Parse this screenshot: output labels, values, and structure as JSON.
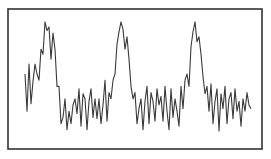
{
  "chart_data": {
    "type": "line",
    "title": "",
    "xlabel": "",
    "ylabel": "",
    "grid": false,
    "legend": null,
    "axes_ticks": false,
    "frame": {
      "x0": 8,
      "y0": 9,
      "x1": 262,
      "y1": 149,
      "color": "#333333"
    },
    "line_color": "#3a3a3a",
    "ylim": [
      0,
      100
    ],
    "series": [
      {
        "name": "signal",
        "x": [
          25,
          27,
          29,
          31,
          33,
          35,
          37,
          39,
          41,
          43,
          45,
          47,
          49,
          51,
          53,
          55,
          57,
          59,
          61,
          63,
          65,
          67,
          69,
          71,
          73,
          75,
          77,
          79,
          81,
          83,
          85,
          87,
          89,
          91,
          93,
          95,
          97,
          99,
          101,
          103,
          105,
          107,
          109,
          111,
          113,
          115,
          117,
          119,
          121,
          123,
          125,
          127,
          129,
          131,
          133,
          135,
          137,
          139,
          141,
          143,
          145,
          147,
          149,
          151,
          153,
          155,
          157,
          159,
          161,
          163,
          165,
          167,
          169,
          171,
          173,
          175,
          177,
          179,
          181,
          183,
          185,
          187,
          189,
          191,
          193,
          195,
          197,
          199,
          201,
          203,
          205,
          207,
          209,
          211,
          213,
          215,
          217,
          219,
          221,
          223,
          225,
          227,
          229,
          231,
          233,
          235,
          237,
          239,
          241,
          243,
          245,
          247,
          249,
          251
        ],
        "values": [
          50,
          20,
          58,
          26,
          44,
          58,
          50,
          45,
          70,
          66,
          92,
          85,
          88,
          62,
          83,
          70,
          40,
          40,
          10,
          15,
          30,
          5,
          20,
          10,
          25,
          30,
          18,
          38,
          8,
          34,
          30,
          5,
          28,
          38,
          15,
          30,
          14,
          30,
          10,
          25,
          45,
          12,
          35,
          30,
          45,
          50,
          74,
          84,
          92,
          86,
          70,
          80,
          62,
          40,
          30,
          35,
          10,
          22,
          30,
          5,
          28,
          40,
          10,
          35,
          28,
          12,
          38,
          25,
          32,
          12,
          40,
          20,
          5,
          38,
          15,
          30,
          20,
          8,
          40,
          22,
          45,
          50,
          40,
          72,
          84,
          92,
          76,
          80,
          66,
          48,
          34,
          40,
          20,
          42,
          10,
          28,
          38,
          4,
          34,
          22,
          40,
          10,
          30,
          35,
          14,
          38,
          20,
          28,
          8,
          30,
          20,
          35,
          25,
          22
        ]
      }
    ]
  }
}
